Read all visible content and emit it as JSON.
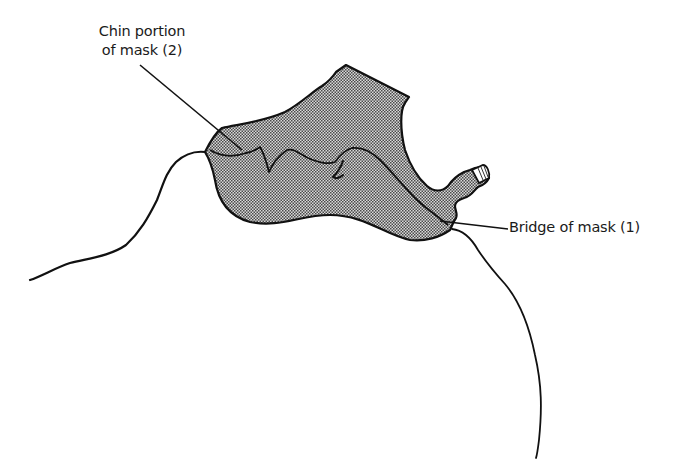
{
  "figure": {
    "colors": {
      "background": "#ffffff",
      "stroke": "#111111",
      "mask_fill": "#b8b8b8",
      "text": "#1a1a1a"
    }
  },
  "labels": {
    "chin": {
      "line1": "Chin portion",
      "line2": "of mask (2)"
    },
    "bridge": {
      "text": "Bridge of mask (1)"
    }
  },
  "parts": [
    {
      "id": 1,
      "name": "Bridge of mask"
    },
    {
      "id": 2,
      "name": "Chin portion of mask"
    }
  ]
}
